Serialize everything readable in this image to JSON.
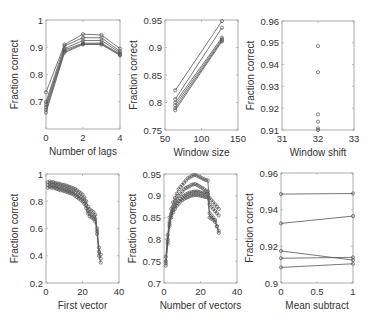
{
  "figure": {
    "width": 375,
    "height": 325
  },
  "chart_data": [
    {
      "type": "line",
      "title": "",
      "xlabel": "Number of lags",
      "ylabel": "Fraction correct",
      "box": {
        "left": 46,
        "top": 20,
        "right": 120,
        "bottom": 129
      },
      "xlim": [
        0,
        4
      ],
      "ylim": [
        0.6,
        1.0
      ],
      "xticks": [
        0,
        2,
        4
      ],
      "xticklabels": [
        "0",
        "2",
        "4"
      ],
      "yticks": [
        0.7,
        0.8,
        0.9,
        1.0
      ],
      "yticklabels": [
        "0.7",
        "0.8",
        "0.9",
        "1"
      ],
      "grid": false,
      "x": [
        0,
        1,
        2,
        3,
        4
      ],
      "series": [
        {
          "name": "s1",
          "values": [
            0.735,
            0.91,
            0.948,
            0.945,
            0.895
          ]
        },
        {
          "name": "s2",
          "values": [
            0.7,
            0.905,
            0.935,
            0.935,
            0.885
          ]
        },
        {
          "name": "s3",
          "values": [
            0.69,
            0.895,
            0.925,
            0.925,
            0.88
          ]
        },
        {
          "name": "s4",
          "values": [
            0.68,
            0.89,
            0.915,
            0.915,
            0.875
          ]
        },
        {
          "name": "s5",
          "values": [
            0.67,
            0.885,
            0.912,
            0.912,
            0.872
          ]
        },
        {
          "name": "s6",
          "values": [
            0.66,
            0.88,
            0.91,
            0.91,
            0.87
          ]
        }
      ]
    },
    {
      "type": "line",
      "title": "",
      "xlabel": "Window size",
      "ylabel": "Fraction correct",
      "box": {
        "left": 165,
        "top": 20,
        "right": 238,
        "bottom": 130
      },
      "xlim": [
        50,
        150
      ],
      "ylim": [
        0.75,
        0.95
      ],
      "xticks": [
        50,
        100,
        150
      ],
      "xticklabels": [
        "50",
        "100",
        "150"
      ],
      "yticks": [
        0.75,
        0.8,
        0.85,
        0.9,
        0.95
      ],
      "yticklabels": [
        "0.75",
        "0.8",
        "0.85",
        "0.9",
        "0.95"
      ],
      "grid": false,
      "x": [
        64,
        128
      ],
      "series": [
        {
          "name": "s1",
          "values": [
            0.822,
            0.948
          ]
        },
        {
          "name": "s2",
          "values": [
            0.806,
            0.936
          ]
        },
        {
          "name": "s3",
          "values": [
            0.8,
            0.918
          ]
        },
        {
          "name": "s4",
          "values": [
            0.795,
            0.915
          ]
        },
        {
          "name": "s5",
          "values": [
            0.79,
            0.913
          ]
        },
        {
          "name": "s6",
          "values": [
            0.786,
            0.911
          ]
        }
      ]
    },
    {
      "type": "scatter",
      "title": "",
      "xlabel": "Window shift",
      "ylabel": "Fraction correct",
      "box": {
        "left": 282,
        "top": 21,
        "right": 354,
        "bottom": 130
      },
      "xlim": [
        31,
        33
      ],
      "ylim": [
        0.91,
        0.96
      ],
      "xticks": [
        31,
        32,
        33
      ],
      "xticklabels": [
        "31",
        "32",
        "33"
      ],
      "yticks": [
        0.91,
        0.92,
        0.93,
        0.94,
        0.95,
        0.96
      ],
      "yticklabels": [
        "0.91",
        "0.92",
        "0.93",
        "0.94",
        "0.95",
        "0.96"
      ],
      "grid": false,
      "x": [
        32,
        32,
        32,
        32,
        32,
        32
      ],
      "values": [
        0.9485,
        0.9365,
        0.9172,
        0.9138,
        0.9108,
        0.91
      ]
    },
    {
      "type": "line",
      "title": "",
      "xlabel": "First vector",
      "ylabel": "Fraction correct",
      "box": {
        "left": 46,
        "top": 174,
        "right": 119,
        "bottom": 283
      },
      "xlim": [
        0,
        40
      ],
      "ylim": [
        0.2,
        1.0
      ],
      "xticks": [
        0,
        20,
        40
      ],
      "xticklabels": [
        "0",
        "20",
        "40"
      ],
      "yticks": [
        0.2,
        0.4,
        0.6,
        0.8,
        1.0
      ],
      "yticklabels": [
        "0.2",
        "0.4",
        "0.6",
        "0.8",
        "1"
      ],
      "grid": false,
      "x": [
        1,
        2,
        3,
        4,
        5,
        6,
        7,
        8,
        9,
        10,
        11,
        12,
        13,
        14,
        15,
        16,
        17,
        18,
        19,
        20,
        21,
        22,
        23,
        24,
        25,
        26,
        27,
        28,
        29,
        30
      ],
      "series": [
        {
          "name": "upper",
          "values": [
            0.94,
            0.945,
            0.94,
            0.94,
            0.935,
            0.93,
            0.93,
            0.925,
            0.92,
            0.92,
            0.915,
            0.91,
            0.905,
            0.9,
            0.895,
            0.89,
            0.88,
            0.87,
            0.86,
            0.85,
            0.83,
            0.8,
            0.76,
            0.74,
            0.73,
            0.72,
            0.7,
            0.6,
            0.46,
            0.41
          ]
        },
        {
          "name": "middle",
          "values": [
            0.92,
            0.925,
            0.92,
            0.92,
            0.915,
            0.91,
            0.905,
            0.9,
            0.9,
            0.895,
            0.89,
            0.885,
            0.88,
            0.875,
            0.87,
            0.86,
            0.85,
            0.84,
            0.83,
            0.82,
            0.8,
            0.77,
            0.73,
            0.71,
            0.7,
            0.69,
            0.67,
            0.58,
            0.43,
            0.38
          ]
        },
        {
          "name": "lower",
          "values": [
            0.9,
            0.905,
            0.9,
            0.9,
            0.895,
            0.89,
            0.885,
            0.88,
            0.88,
            0.875,
            0.87,
            0.865,
            0.86,
            0.855,
            0.85,
            0.84,
            0.83,
            0.82,
            0.81,
            0.8,
            0.78,
            0.75,
            0.71,
            0.69,
            0.68,
            0.67,
            0.65,
            0.56,
            0.4,
            0.35
          ]
        }
      ]
    },
    {
      "type": "line",
      "title": "",
      "xlabel": "Number of vectors",
      "ylabel": "Fraction correct",
      "box": {
        "left": 164,
        "top": 174,
        "right": 237,
        "bottom": 283
      },
      "xlim": [
        0,
        40
      ],
      "ylim": [
        0.7,
        0.95
      ],
      "xticks": [
        0,
        20,
        40
      ],
      "xticklabels": [
        "0",
        "20",
        "40"
      ],
      "yticks": [
        0.7,
        0.75,
        0.8,
        0.85,
        0.9,
        0.95
      ],
      "yticklabels": [
        "0.7",
        "0.75",
        "0.8",
        "0.85",
        "0.9",
        "0.95"
      ],
      "grid": false,
      "x": [
        1,
        2,
        3,
        4,
        5,
        6,
        7,
        8,
        9,
        10,
        11,
        12,
        13,
        14,
        15,
        16,
        17,
        18,
        19,
        20,
        21,
        22,
        23,
        24,
        25,
        26,
        27,
        28,
        29,
        30
      ],
      "series": [
        {
          "name": "s1",
          "values": [
            0.76,
            0.81,
            0.85,
            0.87,
            0.885,
            0.895,
            0.905,
            0.915,
            0.92,
            0.925,
            0.93,
            0.935,
            0.94,
            0.942,
            0.945,
            0.947,
            0.948,
            0.946,
            0.944,
            0.942,
            0.94,
            0.938,
            0.936,
            0.935,
            0.88,
            0.875,
            0.87,
            0.865,
            0.86,
            0.855
          ]
        },
        {
          "name": "s2",
          "values": [
            0.75,
            0.8,
            0.84,
            0.86,
            0.875,
            0.885,
            0.893,
            0.9,
            0.905,
            0.91,
            0.915,
            0.918,
            0.92,
            0.922,
            0.925,
            0.926,
            0.927,
            0.925,
            0.923,
            0.92,
            0.918,
            0.915,
            0.912,
            0.91,
            0.895,
            0.89,
            0.885,
            0.88,
            0.875,
            0.87
          ]
        },
        {
          "name": "s3",
          "values": [
            0.745,
            0.795,
            0.835,
            0.855,
            0.868,
            0.876,
            0.883,
            0.888,
            0.893,
            0.897,
            0.9,
            0.903,
            0.905,
            0.907,
            0.908,
            0.909,
            0.91,
            0.91,
            0.909,
            0.908,
            0.907,
            0.906,
            0.905,
            0.904,
            0.86,
            0.855,
            0.85,
            0.845,
            0.83,
            0.82
          ]
        },
        {
          "name": "s4",
          "values": [
            0.74,
            0.79,
            0.83,
            0.85,
            0.862,
            0.87,
            0.877,
            0.882,
            0.887,
            0.89,
            0.893,
            0.895,
            0.897,
            0.899,
            0.9,
            0.901,
            0.902,
            0.902,
            0.901,
            0.9,
            0.899,
            0.898,
            0.897,
            0.896,
            0.85,
            0.848,
            0.845,
            0.84,
            0.83,
            0.815
          ]
        }
      ]
    },
    {
      "type": "line",
      "title": "",
      "xlabel": "Mean subtract",
      "ylabel": "Fraction correct",
      "box": {
        "left": 281,
        "top": 173,
        "right": 353,
        "bottom": 283
      },
      "xlim": [
        0,
        1
      ],
      "ylim": [
        0.9,
        0.96
      ],
      "xticks": [
        0,
        0.5,
        1
      ],
      "xticklabels": [
        "0",
        "0.5",
        "1"
      ],
      "yticks": [
        0.9,
        0.92,
        0.94,
        0.96
      ],
      "yticklabels": [
        "0.9",
        "0.92",
        "0.94",
        "0.96"
      ],
      "grid": false,
      "x": [
        0,
        1
      ],
      "series": [
        {
          "name": "s1",
          "values": [
            0.9485,
            0.9488
          ]
        },
        {
          "name": "s2",
          "values": [
            0.9325,
            0.9365
          ]
        },
        {
          "name": "s3",
          "values": [
            0.9175,
            0.9125
          ]
        },
        {
          "name": "s4",
          "values": [
            0.9135,
            0.914
          ]
        },
        {
          "name": "s5",
          "values": [
            0.9085,
            0.9105
          ]
        }
      ]
    }
  ]
}
